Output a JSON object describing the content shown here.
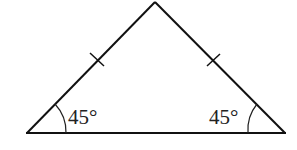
{
  "diagram": {
    "type": "isosceles-triangle",
    "vertices": {
      "apex": [
        155,
        2
      ],
      "left": [
        27,
        133
      ],
      "right": [
        285,
        133
      ]
    },
    "equal_sides": [
      "left-side",
      "right-side"
    ],
    "tick_marks": 2,
    "angles": {
      "left": {
        "label": "45°",
        "value": 45
      },
      "right": {
        "label": "45°",
        "value": 45
      }
    },
    "colors": {
      "stroke": "#111111",
      "text": "#222222",
      "background": "#ffffff"
    }
  }
}
